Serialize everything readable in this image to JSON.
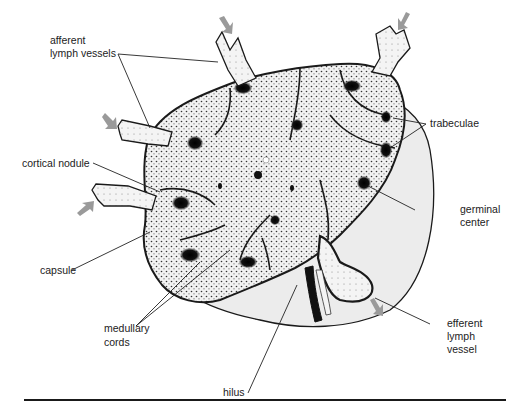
{
  "diagram": {
    "colors": {
      "outline": "#1a1a1a",
      "stipple_fill": "#e9e9e9",
      "capsule_fill": "#ececec",
      "cord_fill": "#c9c9c9",
      "germinal_center": "#111111",
      "arrow": "#9a9a9a",
      "leader_line": "#222222"
    },
    "labels": {
      "afferent_line1": "afferent",
      "afferent_line2": "lymph vessels",
      "trabeculae": "trabeculae",
      "cortical_nodule": "cortical nodule",
      "germinal_line1": "germinal",
      "germinal_line2": "center",
      "capsule": "capsule",
      "medullary_line1": "medullary",
      "medullary_line2": "cords",
      "efferent_line1": "efferent",
      "efferent_line2": "lymph",
      "efferent_line3": "vessel",
      "hilus": "hilus"
    }
  }
}
